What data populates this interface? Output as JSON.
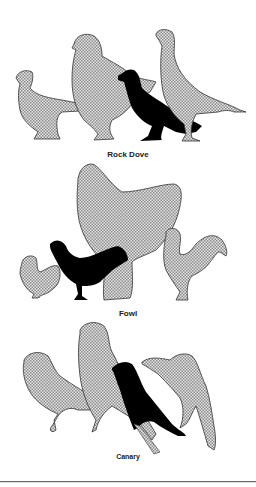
{
  "groups": [
    {
      "label": "Rock Dove",
      "bird_count": 4
    },
    {
      "label": "Fowl",
      "bird_count": 4
    },
    {
      "label": "Canary",
      "bird_count": 4
    }
  ],
  "colors": {
    "stipple_fill": "#c8c8c8",
    "stipple_dot": "#7a7a7a",
    "outline": "#333333",
    "highlight_bird": "#000000",
    "background": "#ffffff"
  }
}
